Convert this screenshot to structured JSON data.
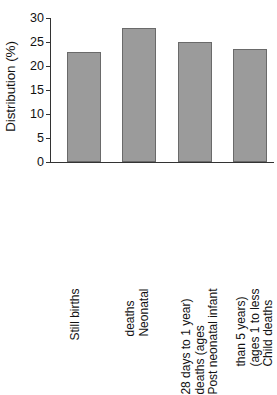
{
  "chart_data": {
    "type": "bar",
    "title": "",
    "xlabel": "",
    "ylabel": "Distribution (%)",
    "ylim": [
      0,
      30
    ],
    "yticks": [
      0,
      5,
      10,
      15,
      20,
      25,
      30
    ],
    "ytick_labels": [
      "0",
      "5",
      "10",
      "15",
      "20",
      "25",
      "30"
    ],
    "grid": false,
    "legend": null,
    "bar_color": "#9b9b9b",
    "bar_edge_color": "#6a6a6a",
    "axis_color": "#333333",
    "background": "#ffffff",
    "categories": [
      "Still births",
      "Neonatal deaths",
      "Post neonatal infant deaths (ages 28 days to 1 year)",
      "Child deaths (ages 1 to less than 5 years)"
    ],
    "category_label_lines": [
      [
        "Still births"
      ],
      [
        "Neonatal",
        "deaths"
      ],
      [
        "Post neonatal infant",
        "deaths (ages",
        "28 days to 1 year)"
      ],
      [
        "Child deaths",
        "(ages 1 to less",
        "than 5 years)"
      ]
    ],
    "values": [
      23.0,
      28.0,
      25.0,
      23.6
    ]
  }
}
